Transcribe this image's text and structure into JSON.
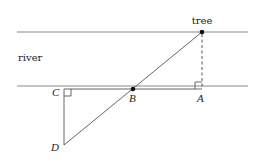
{
  "diagram": {
    "labels": {
      "tree": "tree",
      "river": "river",
      "C": "C",
      "B": "B",
      "A": "A",
      "D": "D"
    },
    "points": {
      "tree": [
        202,
        32
      ],
      "C": [
        64,
        89
      ],
      "B": [
        133,
        89
      ],
      "A": [
        202,
        89
      ],
      "D": [
        64,
        145
      ]
    },
    "colors": {
      "bank": "#8a8a8a",
      "segment": "#555555",
      "point": "#111111"
    }
  }
}
